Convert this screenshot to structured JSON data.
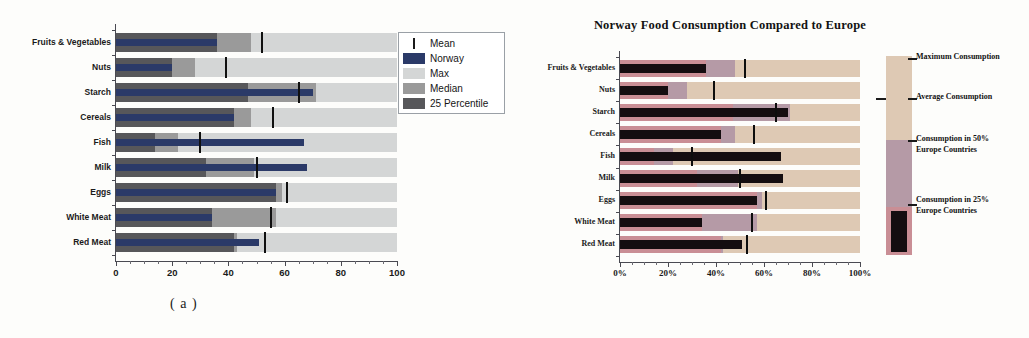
{
  "figure": {
    "captions": {
      "a": "( a )",
      "b": "( b )"
    }
  },
  "panel_a": {
    "legend": {
      "items": [
        {
          "label": "Mean",
          "key": "mean-tick",
          "color": "#1a1a1a"
        },
        {
          "label": "Norway",
          "key": "swatch",
          "color": "#2b3a68"
        },
        {
          "label": "Max",
          "key": "swatch",
          "color": "#d4d6d6"
        },
        {
          "label": "Median",
          "key": "swatch",
          "color": "#9a9a9a"
        },
        {
          "label": "25 Percentile",
          "key": "swatch",
          "color": "#57575a"
        }
      ]
    },
    "chart_data": {
      "type": "bar",
      "orientation": "horizontal",
      "title": "",
      "xlabel": "",
      "ylabel": "",
      "xlim": [
        0,
        100
      ],
      "xticks": [
        0,
        20,
        40,
        60,
        80,
        100
      ],
      "xticklabels": [
        "0",
        "20",
        "40",
        "60",
        "80",
        "100"
      ],
      "minor_tick_step": 5,
      "grid": false,
      "legend_position": "top-right",
      "categories": [
        "Fruits & Vegetables",
        "Nuts",
        "Starch",
        "Cereals",
        "Fish",
        "Milk",
        "Eggs",
        "White Meat",
        "Red Meat"
      ],
      "series": [
        {
          "name": "Max",
          "color": "#d4d6d6",
          "values": [
            100,
            100,
            100,
            100,
            100,
            100,
            100,
            100,
            100
          ]
        },
        {
          "name": "Median",
          "color": "#9a9a9a",
          "values": [
            48,
            28,
            71,
            48,
            22,
            49,
            59,
            57,
            43
          ]
        },
        {
          "name": "25 Percentile",
          "color": "#57575a",
          "values": [
            36,
            20,
            47,
            42,
            14,
            32,
            57,
            34,
            42
          ]
        },
        {
          "name": "Norway",
          "color": "#2b3a68",
          "values": [
            36,
            20,
            70,
            42,
            67,
            68,
            57,
            34,
            51
          ]
        },
        {
          "name": "Mean",
          "color": "#1a1a1a",
          "values": [
            52,
            39,
            65,
            56,
            30,
            50,
            61,
            55,
            53
          ]
        }
      ]
    }
  },
  "panel_b": {
    "title": "Norway Food Consumption Compared to Europe",
    "legend": {
      "items": [
        {
          "label": "Maximum Consumption",
          "color": "#dec9b4"
        },
        {
          "label": "Average Consumption",
          "color": "#1a1a1a"
        },
        {
          "label": "Consumption in 50%\nEurope Countries",
          "line1": "Consumption in 50%",
          "line2": "Europe Countries",
          "color": "#b59aa6"
        },
        {
          "label": "Consumption in 25%\nEurope Countries",
          "line1": "Consumption in 25%",
          "line2": "Europe Countries",
          "color": "#c98e95"
        }
      ]
    },
    "chart_data": {
      "type": "bar",
      "orientation": "horizontal",
      "title": "Norway Food Consumption Compared to Europe",
      "xlabel": "",
      "ylabel": "",
      "xlim": [
        0,
        100
      ],
      "xticks": [
        0,
        20,
        40,
        60,
        80,
        100
      ],
      "xticklabels": [
        "0%",
        "20%",
        "40%",
        "60%",
        "80%",
        "100%"
      ],
      "minor_tick_step": 5,
      "grid": false,
      "legend_position": "right",
      "categories": [
        "Fruits & Vegetables",
        "Nuts",
        "Starch",
        "Cereals",
        "Fish",
        "Milk",
        "Eggs",
        "White Meat",
        "Red Meat"
      ],
      "series": [
        {
          "name": "Maximum Consumption",
          "color": "#dec9b4",
          "values": [
            100,
            100,
            100,
            100,
            100,
            100,
            100,
            100,
            100
          ]
        },
        {
          "name": "Consumption in 50% Europe Countries",
          "color": "#b59aa6",
          "values": [
            48,
            28,
            71,
            48,
            22,
            49,
            59,
            57,
            43
          ]
        },
        {
          "name": "Consumption in 25% Europe Countries",
          "color": "#c98e95",
          "values": [
            36,
            20,
            47,
            42,
            14,
            32,
            57,
            34,
            42
          ]
        },
        {
          "name": "Norway",
          "color": "#140d10",
          "values": [
            36,
            20,
            70,
            42,
            67,
            68,
            57,
            34,
            51
          ]
        },
        {
          "name": "Average Consumption",
          "color": "#0d0d0d",
          "values": [
            52,
            39,
            65,
            56,
            30,
            50,
            61,
            55,
            53
          ]
        }
      ]
    }
  }
}
